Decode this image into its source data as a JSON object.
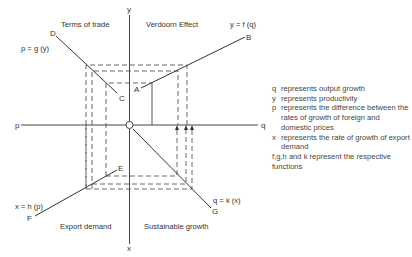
{
  "diagram": {
    "axes": {
      "vertical_top_label": "y",
      "vertical_bottom_label": "x",
      "horizontal_left_label": "p",
      "horizontal_right_label": "q"
    },
    "quadrants": {
      "top_left": "Terms of trade",
      "top_right": "Verdoorn Effect",
      "bottom_left": "Export demand",
      "bottom_right": "Sustainable growth"
    },
    "functions": {
      "top_right": "y = f (q)",
      "top_left": "p = g (y)",
      "bottom_left": "x = h (p)",
      "bottom_right": "q = k (x)"
    },
    "points": {
      "A": "A",
      "B": "B",
      "C": "C",
      "D": "D",
      "E": "E",
      "F": "F",
      "G": "G"
    }
  },
  "legend": {
    "items": [
      {
        "symbol": "q",
        "text": "represents output growth"
      },
      {
        "symbol": "y",
        "text": "represents productivity"
      },
      {
        "symbol": "p",
        "text": "represents the difference between the rates of growth of foreign and domestic prices"
      },
      {
        "symbol": "x",
        "text": "represents the rate of growth of export demand"
      }
    ],
    "footer": {
      "symbol": "f,g,h and k",
      "text": "represent the respective functions"
    }
  }
}
